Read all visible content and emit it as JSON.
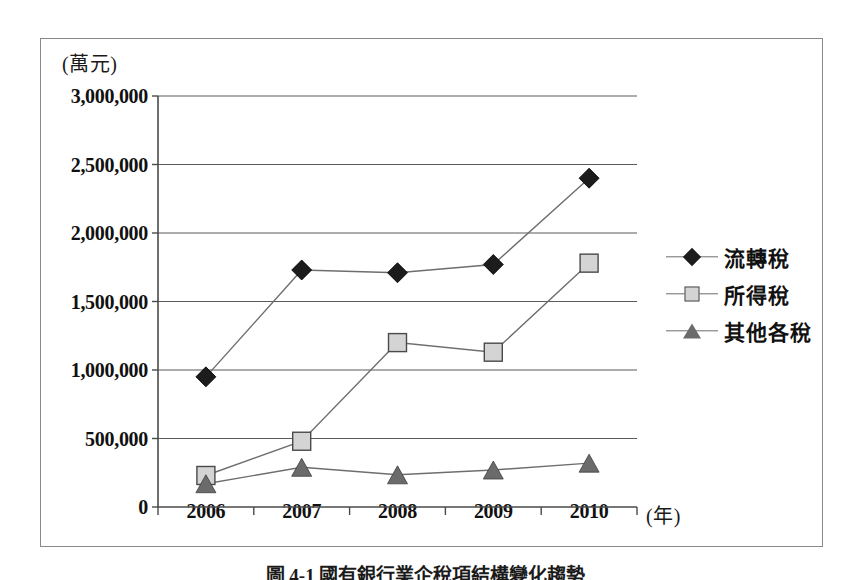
{
  "chart_data": {
    "type": "line",
    "title": "",
    "xlabel": "(年)",
    "ylabel": "(萬元)",
    "categories": [
      "2006",
      "2007",
      "2008",
      "2009",
      "2010"
    ],
    "ylim": [
      0,
      3000000
    ],
    "ytick_labels": [
      "0",
      "500,000",
      "1,000,000",
      "1,500,000",
      "2,000,000",
      "2,500,000",
      "3,000,000"
    ],
    "ytick_values": [
      0,
      500000,
      1000000,
      1500000,
      2000000,
      2500000,
      3000000
    ],
    "grid": "horizontal",
    "legend_position": "right",
    "series": [
      {
        "name": "流轉稅",
        "marker": "diamond",
        "color": "#1c1c1c",
        "values": [
          950000,
          1730000,
          1710000,
          1770000,
          2400000
        ]
      },
      {
        "name": "所得稅",
        "marker": "square",
        "color": "#d4d4d4",
        "values": [
          230000,
          480000,
          1200000,
          1130000,
          1780000
        ]
      },
      {
        "name": "其他各稅",
        "marker": "triangle",
        "color": "#6b6b6b",
        "values": [
          170000,
          290000,
          235000,
          270000,
          320000
        ]
      }
    ]
  },
  "caption": {
    "text": "圖 4-1  國有銀行業企稅項結構變化趨勢"
  },
  "colors": {
    "line": "#6e6e6e",
    "grid": "#5a5a5a",
    "axis": "#4a4a4a",
    "frame": "#8a8a8a"
  }
}
